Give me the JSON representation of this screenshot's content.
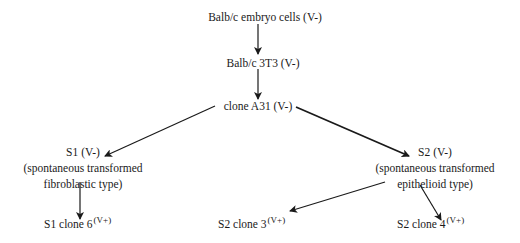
{
  "diagram": {
    "type": "cell-lineage-tree",
    "nodes": [
      {
        "id": "embryo",
        "label": "Balb/c embryo cells (V-)"
      },
      {
        "id": "3t3",
        "label": "Balb/c 3T3 (V-)"
      },
      {
        "id": "a31",
        "label": "clone A31 (V-)"
      },
      {
        "id": "s1",
        "label": "S1 (V-)",
        "desc_line1": "(spontaneous transformed",
        "desc_line2": "fibroblastic type)"
      },
      {
        "id": "s2",
        "label": "S2 (V-)",
        "desc_line1": "(spontaneous transformed",
        "desc_line2": "epithelioid type)"
      },
      {
        "id": "s1c6",
        "label": "S1 clone 6",
        "sup": "(V+)"
      },
      {
        "id": "s2c3",
        "label": "S2 clone 3",
        "sup": "(V+)"
      },
      {
        "id": "s2c4",
        "label": "S2 clone 4",
        "sup": "(V+)"
      }
    ],
    "edges": [
      {
        "from": "embryo",
        "to": "3t3"
      },
      {
        "from": "3t3",
        "to": "a31"
      },
      {
        "from": "a31",
        "to": "s1"
      },
      {
        "from": "a31",
        "to": "s2"
      },
      {
        "from": "s1",
        "to": "s1c6"
      },
      {
        "from": "s2",
        "to": "s2c3"
      },
      {
        "from": "s2",
        "to": "s2c4"
      }
    ],
    "line_color": "#1a1a1a"
  }
}
